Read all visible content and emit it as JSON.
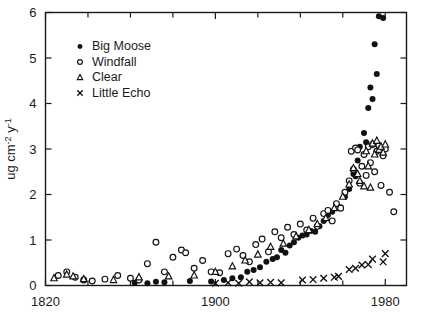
{
  "chart_data": {
    "type": "scatter",
    "title": "",
    "xlabel": "",
    "ylabel": "ug cm-2 y-1",
    "ylabel_parts": {
      "prefix": "ug cm",
      "sup1": "-2",
      "mid": " y",
      "sup2": "-1"
    },
    "xlim": [
      1820,
      1990
    ],
    "ylim": [
      0,
      6
    ],
    "grid": false,
    "legend_position": "upper-left-inside",
    "xticks_major": [
      1820,
      1900,
      1980
    ],
    "xticklabels": [
      "1820",
      "1900",
      "1980"
    ],
    "xticks_minor": [
      1840,
      1860,
      1880,
      1920,
      1940,
      1960
    ],
    "yticks": [
      0,
      1,
      2,
      3,
      4,
      5,
      6
    ],
    "yticklabels": [
      "0",
      "1",
      "2",
      "3",
      "4",
      "5",
      "6"
    ],
    "series": [
      {
        "name": "Big Moose",
        "marker": "filled-circle",
        "points": [
          [
            1862,
            0.06
          ],
          [
            1868,
            0.05
          ],
          [
            1872,
            0.08
          ],
          [
            1876,
            0.07
          ],
          [
            1888,
            0.1
          ],
          [
            1898,
            0.09
          ],
          [
            1904,
            0.12
          ],
          [
            1908,
            0.16
          ],
          [
            1912,
            0.18
          ],
          [
            1915,
            0.3
          ],
          [
            1918,
            0.34
          ],
          [
            1921,
            0.4
          ],
          [
            1924,
            0.52
          ],
          [
            1927,
            0.58
          ],
          [
            1929,
            0.62
          ],
          [
            1931,
            0.78
          ],
          [
            1933,
            0.72
          ],
          [
            1935,
            0.88
          ],
          [
            1937,
            0.95
          ],
          [
            1939,
            1.05
          ],
          [
            1941,
            1.1
          ],
          [
            1943,
            1.12
          ],
          [
            1945,
            1.2
          ],
          [
            1947,
            1.18
          ],
          [
            1949,
            1.3
          ],
          [
            1951,
            1.42
          ],
          [
            1953,
            1.55
          ],
          [
            1955,
            1.62
          ],
          [
            1957,
            1.78
          ],
          [
            1959,
            1.72
          ],
          [
            1961,
            1.95
          ],
          [
            1963,
            2.12
          ],
          [
            1965,
            2.45
          ],
          [
            1966,
            2.4
          ],
          [
            1967,
            2.75
          ],
          [
            1968,
            3.05
          ],
          [
            1969,
            2.62
          ],
          [
            1970,
            3.35
          ],
          [
            1971,
            3.15
          ],
          [
            1972,
            3.9
          ],
          [
            1973,
            4.35
          ],
          [
            1974,
            4.1
          ],
          [
            1975,
            5.3
          ],
          [
            1976,
            4.65
          ],
          [
            1977,
            5.92
          ],
          [
            1979,
            5.88
          ]
        ]
      },
      {
        "name": "Windfall",
        "marker": "open-circle",
        "points": [
          [
            1826,
            0.22
          ],
          [
            1830,
            0.3
          ],
          [
            1834,
            0.18
          ],
          [
            1838,
            0.12
          ],
          [
            1842,
            0.1
          ],
          [
            1848,
            0.14
          ],
          [
            1854,
            0.22
          ],
          [
            1860,
            0.16
          ],
          [
            1864,
            0.12
          ],
          [
            1868,
            0.48
          ],
          [
            1872,
            0.95
          ],
          [
            1876,
            0.3
          ],
          [
            1880,
            0.62
          ],
          [
            1884,
            0.78
          ],
          [
            1886,
            0.72
          ],
          [
            1890,
            0.38
          ],
          [
            1894,
            0.55
          ],
          [
            1898,
            0.3
          ],
          [
            1902,
            0.28
          ],
          [
            1906,
            0.7
          ],
          [
            1910,
            0.8
          ],
          [
            1913,
            0.66
          ],
          [
            1916,
            0.52
          ],
          [
            1919,
            0.9
          ],
          [
            1922,
            1.02
          ],
          [
            1925,
            0.74
          ],
          [
            1928,
            1.18
          ],
          [
            1931,
            1.05
          ],
          [
            1934,
            1.28
          ],
          [
            1937,
            1.12
          ],
          [
            1940,
            1.35
          ],
          [
            1943,
            1.22
          ],
          [
            1946,
            1.48
          ],
          [
            1948,
            1.3
          ],
          [
            1951,
            1.58
          ],
          [
            1953,
            1.65
          ],
          [
            1955,
            1.42
          ],
          [
            1957,
            1.8
          ],
          [
            1959,
            1.7
          ],
          [
            1961,
            2.05
          ],
          [
            1963,
            2.3
          ],
          [
            1964,
            2.95
          ],
          [
            1965,
            2.55
          ],
          [
            1966,
            3.02
          ],
          [
            1967,
            2.98
          ],
          [
            1968,
            2.25
          ],
          [
            1969,
            2.62
          ],
          [
            1970,
            2.88
          ],
          [
            1971,
            2.42
          ],
          [
            1972,
            3.05
          ],
          [
            1973,
            2.7
          ],
          [
            1974,
            3.1
          ],
          [
            1975,
            2.5
          ],
          [
            1976,
            2.95
          ],
          [
            1977,
            3.08
          ],
          [
            1978,
            2.2
          ],
          [
            1979,
            2.85
          ],
          [
            1980,
            3.0
          ],
          [
            1982,
            2.05
          ],
          [
            1984,
            1.62
          ]
        ]
      },
      {
        "name": "Clear",
        "marker": "open-triangle",
        "points": [
          [
            1824,
            0.16
          ],
          [
            1830,
            0.24
          ],
          [
            1833,
            0.2
          ],
          [
            1838,
            0.14
          ],
          [
            1852,
            0.12
          ],
          [
            1864,
            0.18
          ],
          [
            1878,
            0.2
          ],
          [
            1890,
            0.22
          ],
          [
            1900,
            0.3
          ],
          [
            1908,
            0.42
          ],
          [
            1914,
            0.55
          ],
          [
            1920,
            0.68
          ],
          [
            1926,
            0.85
          ],
          [
            1932,
            0.92
          ],
          [
            1938,
            1.08
          ],
          [
            1944,
            1.22
          ],
          [
            1948,
            1.35
          ],
          [
            1952,
            1.48
          ],
          [
            1956,
            1.7
          ],
          [
            1960,
            1.95
          ],
          [
            1963,
            2.22
          ],
          [
            1965,
            2.58
          ],
          [
            1967,
            2.45
          ],
          [
            1968,
            2.3
          ],
          [
            1970,
            2.18
          ],
          [
            1971,
            2.95
          ],
          [
            1972,
            2.62
          ],
          [
            1973,
            2.15
          ],
          [
            1974,
            3.12
          ],
          [
            1975,
            2.88
          ],
          [
            1976,
            3.18
          ],
          [
            1977,
            2.98
          ],
          [
            1978,
            3.05
          ],
          [
            1979,
            2.92
          ],
          [
            1980,
            3.1
          ]
        ]
      },
      {
        "name": "Little Echo",
        "marker": "cross-x",
        "points": [
          [
            1900,
            0.05
          ],
          [
            1906,
            0.06
          ],
          [
            1911,
            0.05
          ],
          [
            1916,
            0.08
          ],
          [
            1921,
            0.06
          ],
          [
            1926,
            0.07
          ],
          [
            1931,
            0.06
          ],
          [
            1941,
            0.12
          ],
          [
            1946,
            0.13
          ],
          [
            1951,
            0.16
          ],
          [
            1956,
            0.18
          ],
          [
            1958,
            0.2
          ],
          [
            1963,
            0.35
          ],
          [
            1966,
            0.38
          ],
          [
            1969,
            0.45
          ],
          [
            1972,
            0.46
          ],
          [
            1974,
            0.58
          ],
          [
            1979,
            0.52
          ],
          [
            1980,
            0.7
          ]
        ]
      }
    ]
  },
  "legend": {
    "entries": [
      {
        "label": "Big Moose",
        "marker": "filled-circle"
      },
      {
        "label": "Windfall",
        "marker": "open-circle"
      },
      {
        "label": "Clear",
        "marker": "open-triangle"
      },
      {
        "label": "Little Echo",
        "marker": "cross-x"
      }
    ]
  }
}
